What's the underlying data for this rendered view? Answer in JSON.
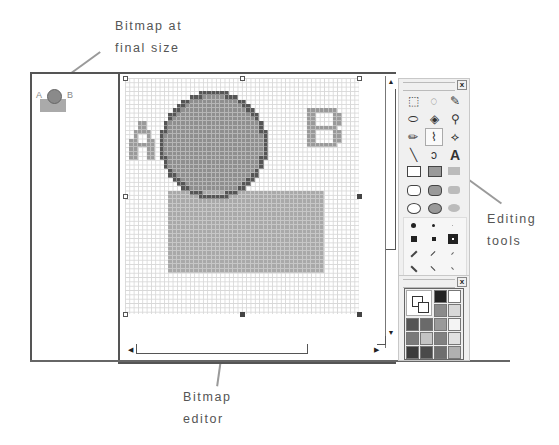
{
  "callouts": {
    "top": [
      "Bitmap  at",
      "final  size"
    ],
    "right": [
      "Editing",
      "tools"
    ],
    "bottom": [
      "Bitmap",
      "editor"
    ]
  },
  "thumbnail": {
    "letter_a": "A",
    "letter_b": "B"
  },
  "canvas": {
    "cell": 4.333,
    "cols": 54,
    "rows": 54,
    "colors": {
      "letter": "#9a9a9a",
      "circle_fill": "#8f8f8f",
      "circle_edge": "#555555",
      "rect": "#a9a9a9",
      "grid": "#d8d8d8"
    },
    "rect": {
      "x0": 10,
      "y0": 26,
      "x1": 45,
      "y1": 44
    },
    "circle": {
      "cx": 20.5,
      "cy": 15.5,
      "r": 12
    },
    "letter_a": {
      "x": 1,
      "y": 10,
      "rows": [
        "..XX..",
        "..XX..",
        ".XXXX.",
        ".X..X.",
        "XX..XX",
        "XXXXXX",
        "XX..XX",
        "XX..XX",
        "XX..XX"
      ]
    },
    "letter_b": {
      "x": 42,
      "y": 7,
      "rows": [
        "XXXXXXX.",
        "XX....XX",
        "XX....XX",
        "XX....XX",
        "XXXXXXX.",
        "XX....XX",
        "XX....XX",
        "XX....XX",
        "XXXXXXX."
      ]
    }
  },
  "scrollbars": {
    "up": "▲",
    "down": "▼",
    "left": "◀",
    "right": "▶"
  },
  "tools_panel": {
    "close": "x",
    "tools": [
      {
        "name": "select-rect",
        "glyph": "⬚"
      },
      {
        "name": "select-free",
        "glyph": "◌"
      },
      {
        "name": "dropper",
        "glyph": "✎"
      },
      {
        "name": "eraser",
        "glyph": "⬭"
      },
      {
        "name": "fill-bucket",
        "glyph": "◈"
      },
      {
        "name": "magnifier",
        "glyph": "⚲"
      },
      {
        "name": "pencil",
        "glyph": "✏"
      },
      {
        "name": "brush",
        "glyph": "⌇"
      },
      {
        "name": "airbrush",
        "glyph": "⟡"
      },
      {
        "name": "line",
        "glyph": "╲"
      },
      {
        "name": "curve",
        "glyph": "ↄ"
      },
      {
        "name": "text",
        "glyph": "A"
      }
    ],
    "active_tool": 7
  },
  "palette_panel": {
    "close": "x",
    "colors": [
      "#222222",
      "#ffffff",
      "#8a8a8a",
      "#d8d8d8",
      "#555555",
      "#6a6a6a",
      "#9a9a9a",
      "#f4f4f4",
      "#7a7a7a",
      "#c4c4c4",
      "#808080",
      "#e0e0e0",
      "#3a3a3a",
      "#4a4a4a",
      "#6e6e6e",
      "#b0b0b0"
    ]
  }
}
